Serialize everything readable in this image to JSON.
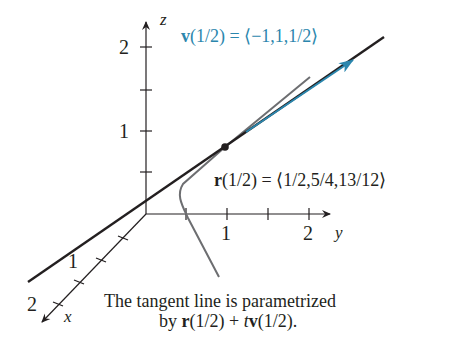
{
  "figure": {
    "axes": {
      "z": {
        "label": "z",
        "ticks": [
          {
            "pos": 1,
            "label": "1"
          },
          {
            "pos": 2,
            "label": "2"
          }
        ]
      },
      "y": {
        "label": "y",
        "ticks": [
          {
            "pos": 1,
            "label": "1"
          },
          {
            "pos": 2,
            "label": "2"
          }
        ]
      },
      "x": {
        "label": "x",
        "ticks": [
          {
            "pos": 1,
            "label": "1"
          },
          {
            "pos": 2,
            "label": "2"
          }
        ]
      }
    },
    "velocity_label": {
      "symbol": "v",
      "arg": "(1/2) = ⟨−1,1,1/2⟩"
    },
    "point_label": {
      "symbol": "r",
      "arg": "(1/2) = ⟨1/2,5/4,13/12⟩"
    },
    "caption": {
      "line1": "The tangent line is parametrized",
      "line2_prefix": "by ",
      "line2_r": "r",
      "line2_mid": "(1/2) + ",
      "line2_t": "t",
      "line2_v": "v",
      "line2_end": "(1/2)."
    },
    "colors": {
      "axis": "#231f20",
      "tangent_line": "#231f20",
      "curve": "#6d6e71",
      "vector": "#2b86ad"
    }
  }
}
